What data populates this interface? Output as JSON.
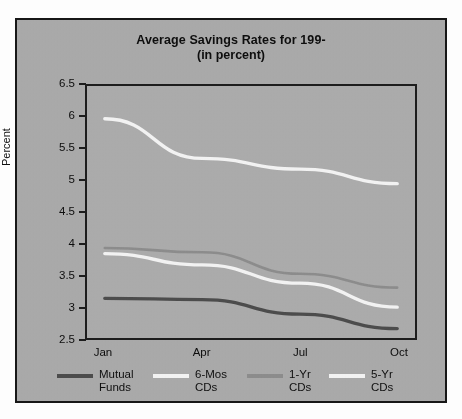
{
  "figure": {
    "title": "Average Savings Rates for 199-",
    "subtitle": "(in percent)",
    "background_color": "#a9a9a9",
    "frame_color": "#171717",
    "page_color": "#fdfdfd"
  },
  "chart_data": {
    "type": "line",
    "title": "Average Savings Rates for 199-",
    "subtitle": "(in percent)",
    "xlabel": "",
    "ylabel": "Percent",
    "categories": [
      "Jan",
      "Apr",
      "Jul",
      "Oct"
    ],
    "x_tick_labels": [
      "Jan",
      "Apr",
      "Jul",
      "Oct"
    ],
    "y_tick_labels": [
      "6.5",
      "6",
      "5.5",
      "5",
      "4.5",
      "4",
      "3.5",
      "3",
      "2.5"
    ],
    "y_tick_values": [
      6.5,
      6,
      5.5,
      5,
      4.5,
      4,
      3.5,
      3,
      2.5
    ],
    "ylim": [
      2.5,
      6.5
    ],
    "grid": false,
    "legend_position": "bottom",
    "series": [
      {
        "name": "Mutual Funds",
        "legend_label": "Mutual\nFunds",
        "color": "#4c4c4c",
        "values": [
          3.13,
          3.11,
          2.88,
          2.65
        ]
      },
      {
        "name": "6-Mos CDs",
        "legend_label": "6-Mos\nCDs",
        "color": "#f2f2f2",
        "values": [
          5.98,
          5.35,
          5.18,
          4.95
        ]
      },
      {
        "name": "1-Yr CDs",
        "legend_label": "1-Yr\nCDs",
        "color": "#8c8c8c",
        "values": [
          3.93,
          3.86,
          3.52,
          3.3
        ]
      },
      {
        "name": "5-Yr CDs",
        "legend_label": "5-Yr\nCDs",
        "color": "#f2f2f2",
        "values": [
          3.84,
          3.66,
          3.37,
          2.99
        ]
      }
    ]
  },
  "legend": {
    "items": [
      {
        "label": "Mutual\nFunds",
        "color": "#4c4c4c"
      },
      {
        "label": "6-Mos\nCDs",
        "color": "#f2f2f2"
      },
      {
        "label": "1-Yr\nCDs",
        "color": "#8c8c8c"
      },
      {
        "label": "5-Yr\nCDs",
        "color": "#f2f2f2"
      }
    ]
  }
}
